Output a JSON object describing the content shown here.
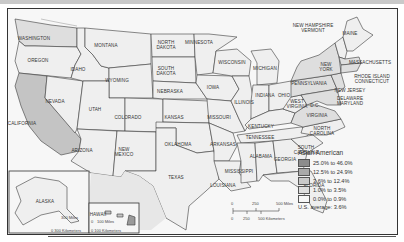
{
  "map": {
    "title": "Asian American",
    "states": [
      {
        "id": "washington",
        "label": "WASHINGTON",
        "x": 34,
        "y": 36
      },
      {
        "id": "oregon",
        "label": "OREGON",
        "x": 38,
        "y": 58
      },
      {
        "id": "california",
        "label": "CALIFORNIA",
        "x": 22,
        "y": 121
      },
      {
        "id": "nevada",
        "label": "NEVADA",
        "x": 55,
        "y": 99
      },
      {
        "id": "idaho",
        "label": "IDAHO",
        "x": 78,
        "y": 67
      },
      {
        "id": "montana",
        "label": "MONTANA",
        "x": 106,
        "y": 43
      },
      {
        "id": "wyoming",
        "label": "WYOMING",
        "x": 117,
        "y": 78
      },
      {
        "id": "utah",
        "label": "UTAH",
        "x": 95,
        "y": 107
      },
      {
        "id": "colorado",
        "label": "COLORADO",
        "x": 128,
        "y": 115
      },
      {
        "id": "arizona",
        "label": "ARIZONA",
        "x": 82,
        "y": 148
      },
      {
        "id": "new-mexico",
        "label": "NEW\nMEXICO",
        "x": 124,
        "y": 147
      },
      {
        "id": "north-dakota",
        "label": "NORTH\nDAKOTA",
        "x": 166,
        "y": 40
      },
      {
        "id": "south-dakota",
        "label": "SOUTH\nDAKOTA",
        "x": 166,
        "y": 66
      },
      {
        "id": "nebraska",
        "label": "NEBRASKA",
        "x": 170,
        "y": 89
      },
      {
        "id": "kansas",
        "label": "KANSAS",
        "x": 174,
        "y": 115
      },
      {
        "id": "oklahoma",
        "label": "OKLAHOMA",
        "x": 178,
        "y": 142
      },
      {
        "id": "texas",
        "label": "TEXAS",
        "x": 176,
        "y": 175
      },
      {
        "id": "minnesota",
        "label": "MINNESOTA",
        "x": 199,
        "y": 40
      },
      {
        "id": "iowa",
        "label": "IOWA",
        "x": 213,
        "y": 85
      },
      {
        "id": "missouri",
        "label": "MISSOURI",
        "x": 219,
        "y": 115
      },
      {
        "id": "arkansas",
        "label": "ARKANSAS",
        "x": 223,
        "y": 142
      },
      {
        "id": "louisiana",
        "label": "LOUISIANA",
        "x": 223,
        "y": 183
      },
      {
        "id": "wisconsin",
        "label": "WISCONSIN",
        "x": 232,
        "y": 60
      },
      {
        "id": "illinois",
        "label": "ILLINOIS",
        "x": 244,
        "y": 100
      },
      {
        "id": "michigan",
        "label": "MICHIGAN",
        "x": 265,
        "y": 66
      },
      {
        "id": "indiana",
        "label": "INDIANA",
        "x": 265,
        "y": 93
      },
      {
        "id": "ohio",
        "label": "OHIO",
        "x": 284,
        "y": 93
      },
      {
        "id": "kentucky",
        "label": "KENTUCKY",
        "x": 261,
        "y": 124
      },
      {
        "id": "tennessee",
        "label": "TENNESSEE",
        "x": 260,
        "y": 135
      },
      {
        "id": "mississippi",
        "label": "MISSISSIPPI",
        "x": 239,
        "y": 169
      },
      {
        "id": "alabama",
        "label": "ALABAMA",
        "x": 261,
        "y": 154
      },
      {
        "id": "georgia",
        "label": "GEORGIA",
        "x": 285,
        "y": 157
      },
      {
        "id": "florida",
        "label": "FLORIDA",
        "x": 314,
        "y": 183
      },
      {
        "id": "south-carolina",
        "label": "SOUTH\nCAROLINA",
        "x": 306,
        "y": 145
      },
      {
        "id": "north-carolina",
        "label": "NORTH\nCAROLINA",
        "x": 322,
        "y": 126
      },
      {
        "id": "virginia",
        "label": "VIRGINIA",
        "x": 317,
        "y": 113
      },
      {
        "id": "west-virginia",
        "label": "WEST\nVIRGINIA",
        "x": 297,
        "y": 99
      },
      {
        "id": "dc",
        "label": "D.C.",
        "x": 315,
        "y": 103
      },
      {
        "id": "pennsylvania",
        "label": "PENNSYLVANIA",
        "x": 309,
        "y": 81
      },
      {
        "id": "new-york",
        "label": "NEW\nYORK",
        "x": 326,
        "y": 62
      },
      {
        "id": "new-jersey",
        "label": "NEW JERSEY",
        "x": 350,
        "y": 88
      },
      {
        "id": "delaware-maryland",
        "label": "DELAWARE\nMARYLAND",
        "x": 350,
        "y": 96
      },
      {
        "id": "massachusetts",
        "label": "MASSACHUSETTS",
        "x": 370,
        "y": 60
      },
      {
        "id": "rhode-island-connecticut",
        "label": "RHODE ISLAND\nCONNECTICUT",
        "x": 372,
        "y": 74
      },
      {
        "id": "maine",
        "label": "MAINE",
        "x": 350,
        "y": 31
      },
      {
        "id": "new-hampshire-vermont",
        "label": "NEW HAMPSHIRE\nVERMONT",
        "x": 313,
        "y": 23
      },
      {
        "id": "alaska",
        "label": "ALASKA",
        "x": 45,
        "y": 199
      },
      {
        "id": "hawaii",
        "label": "HAWAII",
        "x": 98,
        "y": 212
      }
    ],
    "legend": {
      "title": "Asian American",
      "items": [
        {
          "label": "25.0% to 46.0%",
          "color": "#8c8c8c"
        },
        {
          "label": "12.5% to 24.9%",
          "color": "#a9a9a9"
        },
        {
          "label": "3.6% to 12.4%",
          "color": "#c9c9c9"
        },
        {
          "label": "1.0% to 3.5%",
          "color": "#dedede"
        },
        {
          "label": "0.0% to 0.9%",
          "color": "#f6f6f6"
        }
      ],
      "average": "U.S. average:  3.6%"
    },
    "scale_main": {
      "miles_ticks": [
        "0",
        "250",
        "500 Miles"
      ],
      "km_ticks": [
        "0",
        "250",
        "500 Kilometers"
      ]
    },
    "scale_alaska": {
      "miles": "300 Miles",
      "km": "0  300 Kilometers"
    },
    "scale_hawaii": {
      "miles_zero": "0",
      "miles": "100 Miles",
      "km": "0  100 Kilometers"
    }
  }
}
